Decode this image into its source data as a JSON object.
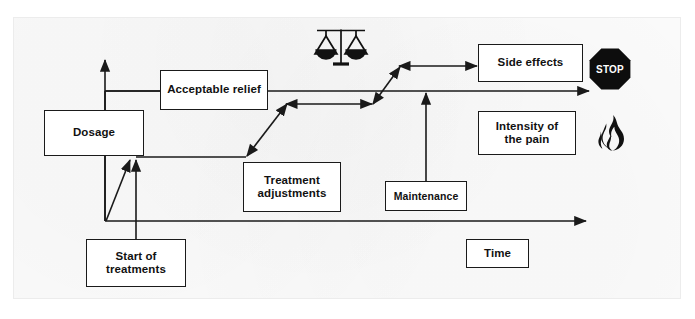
{
  "figure": {
    "type": "flow-diagram",
    "nodes": [
      {
        "id": "dosage",
        "label": "Dosage"
      },
      {
        "id": "relief",
        "label": "Acceptable relief"
      },
      {
        "id": "adjustments",
        "label_line1": "Treatment",
        "label_line2": "adjustments"
      },
      {
        "id": "start",
        "label_line1": "Start of",
        "label_line2": "treatments"
      },
      {
        "id": "maintenance",
        "label": "Maintenance"
      },
      {
        "id": "side_effects",
        "label": "Side effects"
      },
      {
        "id": "intensity",
        "label_line1": "Intensity of",
        "label_line2": "the pain"
      },
      {
        "id": "time",
        "label": "Time"
      }
    ],
    "icons": [
      {
        "id": "scales",
        "name": "balance-scales-icon",
        "meaning": "balance between relief and side effects"
      },
      {
        "id": "stop",
        "name": "stop-sign-icon",
        "text": "STOP"
      },
      {
        "id": "flame",
        "name": "flame-icon",
        "meaning": "pain"
      }
    ],
    "axes": {
      "y_axis": {
        "name": "dosage-axis",
        "direction": "up"
      },
      "x_axis": {
        "name": "time-axis",
        "direction": "right",
        "label": "Time"
      }
    },
    "colors": {
      "stroke": "#1a1a1a",
      "node_fill": "#ffffff",
      "icon_fill": "#111111",
      "stop_text": "#ffffff",
      "paper": "#fbfbfb",
      "paper_border": "#ececec"
    }
  }
}
